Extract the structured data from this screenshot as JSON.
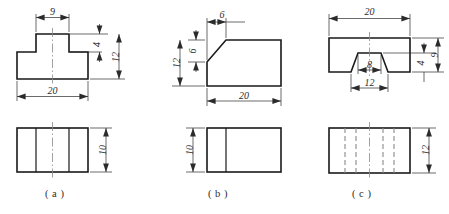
{
  "drawing": {
    "title": "Orthographic projection exercise - three parts",
    "sheet_width": 449,
    "sheet_height": 214,
    "line_color": "#1a1a1a",
    "dim_color": "#2b2b2b",
    "center_color": "#8a8a8a",
    "hidden_color": "#8a8a8a",
    "background": "#ffffff"
  },
  "figures": [
    {
      "id": "a",
      "label": "( a )",
      "description": "T-shaped block, front view and top view",
      "front_view": {
        "shape": "tee",
        "dimensions": [
          {
            "name": "top-width",
            "value": "9",
            "orientation": "horizontal",
            "position": "above"
          },
          {
            "name": "overall-width",
            "value": "20",
            "orientation": "horizontal",
            "position": "below"
          },
          {
            "name": "rib-height",
            "value": "4",
            "orientation": "vertical",
            "position": "right-inner"
          },
          {
            "name": "overall-height",
            "value": "12",
            "orientation": "vertical",
            "position": "right-outer"
          }
        ]
      },
      "top_view": {
        "shape": "rectangle-with-two-solid-lines",
        "dimensions": [
          {
            "name": "depth",
            "value": "10",
            "orientation": "vertical",
            "position": "right"
          }
        ]
      }
    },
    {
      "id": "b",
      "label": "( b )",
      "description": "Block with chamfered upper-left corner, front view and top view",
      "front_view": {
        "shape": "chamfered-block",
        "dimensions": [
          {
            "name": "chamfer-width",
            "value": "6",
            "orientation": "horizontal",
            "position": "above"
          },
          {
            "name": "chamfer-height",
            "value": "6",
            "orientation": "vertical",
            "position": "left-inner"
          },
          {
            "name": "overall-height",
            "value": "12",
            "orientation": "vertical",
            "position": "left-outer"
          },
          {
            "name": "overall-width",
            "value": "20",
            "orientation": "horizontal",
            "position": "below"
          }
        ]
      },
      "top_view": {
        "shape": "rectangle-with-one-solid-line",
        "dimensions": [
          {
            "name": "depth",
            "value": "10",
            "orientation": "vertical",
            "position": "left"
          }
        ]
      }
    },
    {
      "id": "c",
      "label": "( c )",
      "description": "Block with dovetail groove, front view and top view",
      "front_view": {
        "shape": "dovetail-groove-block",
        "dimensions": [
          {
            "name": "overall-width",
            "value": "20",
            "orientation": "horizontal",
            "position": "above"
          },
          {
            "name": "overall-height",
            "value": "9",
            "orientation": "vertical",
            "position": "right-outer"
          },
          {
            "name": "groove-depth",
            "value": "4",
            "orientation": "vertical",
            "position": "right-inner"
          },
          {
            "name": "groove-top-width",
            "value": "8",
            "orientation": "horizontal",
            "position": "inner"
          },
          {
            "name": "groove-bottom-width",
            "value": "12",
            "orientation": "horizontal",
            "position": "below"
          }
        ]
      },
      "top_view": {
        "shape": "rectangle-with-four-hidden-lines",
        "dimensions": [
          {
            "name": "depth",
            "value": "12",
            "orientation": "vertical",
            "position": "right"
          }
        ]
      }
    }
  ]
}
